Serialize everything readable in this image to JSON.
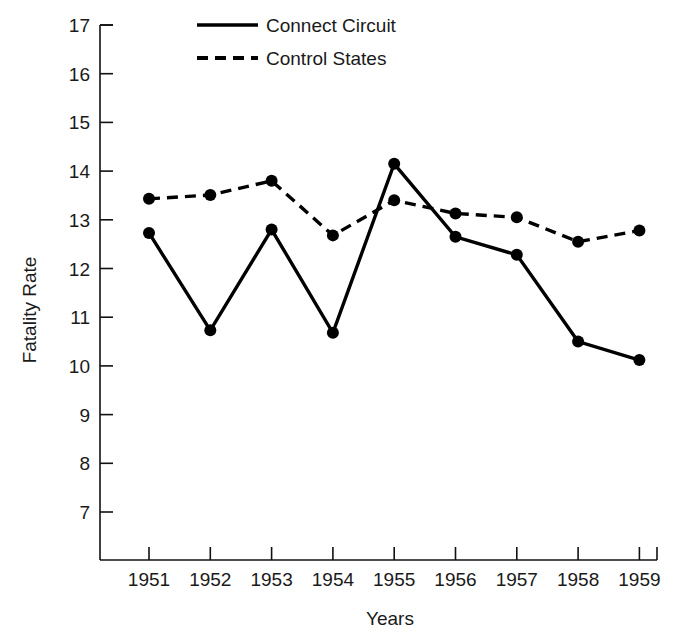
{
  "chart_data": {
    "type": "line",
    "title": "",
    "xlabel": "Years",
    "ylabel": "Fatality Rate",
    "categories": [
      "1951",
      "1952",
      "1953",
      "1954",
      "1955",
      "1956",
      "1957",
      "1958",
      "1959"
    ],
    "x": [
      1951,
      1952,
      1953,
      1954,
      1955,
      1956,
      1957,
      1958,
      1959
    ],
    "xlim": [
      1950.6,
      1959.4
    ],
    "ylim": [
      6.5,
      17
    ],
    "yticks": [
      7,
      8,
      9,
      10,
      11,
      12,
      13,
      14,
      15,
      16,
      17
    ],
    "ytick_labels": [
      "7",
      "8",
      "9",
      "10",
      "11",
      "12",
      "13",
      "14",
      "15",
      "16",
      "17"
    ],
    "grid": false,
    "legend_position": "top-center",
    "series": [
      {
        "name": "Connect Circuit",
        "style": "solid",
        "marker": "circle",
        "color": "#000000",
        "values": [
          12.73,
          10.73,
          12.8,
          10.68,
          14.15,
          12.65,
          12.28,
          10.5,
          10.12
        ]
      },
      {
        "name": "Control States",
        "style": "dashed",
        "marker": "circle",
        "color": "#000000",
        "values": [
          13.43,
          13.51,
          13.8,
          12.68,
          13.4,
          13.13,
          13.05,
          12.55,
          12.78
        ]
      }
    ]
  },
  "legend": {
    "entries": [
      {
        "label": "Connect Circuit"
      },
      {
        "label": "Control States"
      }
    ]
  },
  "axes": {
    "y_title": "Fatality Rate",
    "x_title": "Years"
  }
}
